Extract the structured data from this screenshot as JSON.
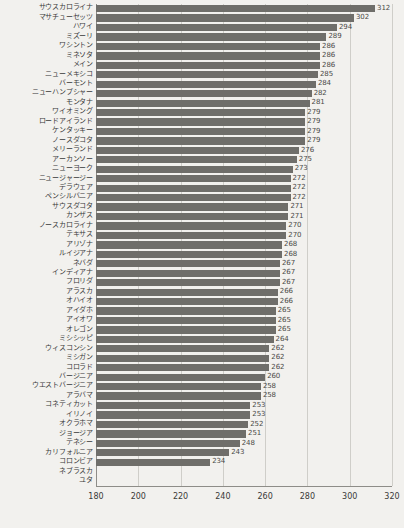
{
  "chart_data": {
    "type": "bar",
    "orientation": "horizontal",
    "title": "",
    "subtitle": "",
    "xlabel": "",
    "ylabel": "",
    "xlim": [
      180,
      320
    ],
    "xticks": [
      180,
      200,
      220,
      240,
      260,
      280,
      300,
      320
    ],
    "grid": true,
    "legend": false,
    "bar_color": "#6f6e6a",
    "background_color": "#f2f1ee",
    "categories": [
      "サウスカロライナ",
      "マサチューセッツ",
      "ハワイ",
      "ミズーリ",
      "ワシントン",
      "ミネソタ",
      "メイン",
      "ニューメキシコ",
      "バーモント",
      "ニューハンプシャー",
      "モンタナ",
      "ワイオミング",
      "ロードアイランド",
      "ケンタッキー",
      "ノースダコタ",
      "メリーランド",
      "アーカンソー",
      "ニューヨーク",
      "ニュージャージー",
      "デラウェア",
      "ペンシルバニア",
      "サウスダコタ",
      "カンザス",
      "ノースカロライナ",
      "テキサス",
      "アリゾナ",
      "ルイジアナ",
      "ネバダ",
      "インディアナ",
      "フロリダ",
      "アラスカ",
      "オハイオ",
      "アイダホ",
      "アイオワ",
      "オレゴン",
      "ミシシッピ",
      "ウィスコンシン",
      "ミシガン",
      "コロラド",
      "バージニア",
      "ウエストバージニア",
      "アラバマ",
      "コネティカット",
      "イリノイ",
      "オクラホマ",
      "ジョージア",
      "テネシー",
      "カリフォルニア",
      "コロンビア",
      "ネブラスカ",
      "ユタ"
    ],
    "values": [
      312,
      302,
      294,
      289,
      286,
      286,
      286,
      285,
      284,
      282,
      281,
      279,
      279,
      279,
      279,
      276,
      275,
      273,
      272,
      272,
      272,
      271,
      271,
      270,
      270,
      268,
      268,
      267,
      267,
      267,
      266,
      266,
      265,
      265,
      265,
      264,
      262,
      262,
      262,
      260,
      258,
      258,
      253,
      253,
      252,
      251,
      248,
      243,
      234,
      null,
      null
    ],
    "value_labels": [
      "312",
      "302",
      "294",
      "289",
      "286",
      "286",
      "286",
      "285",
      "284",
      "282",
      "281",
      "279",
      "279",
      "279",
      "279",
      "276",
      "275",
      "273",
      "272",
      "272",
      "272",
      "271",
      "271",
      "270",
      "270",
      "268",
      "268",
      "267",
      "267",
      "267",
      "266",
      "266",
      "265",
      "265",
      "265",
      "264",
      "262",
      "262",
      "262",
      "260",
      "258",
      "258",
      "253",
      "253",
      "252",
      "251",
      "248",
      "243",
      "234",
      "",
      ""
    ]
  }
}
